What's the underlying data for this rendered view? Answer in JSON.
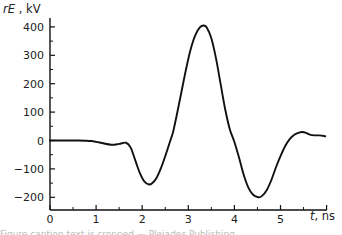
{
  "chart_data": {
    "type": "line",
    "title": "",
    "xlabel": "t, ns",
    "ylabel": "rE , kV",
    "x_label_italic_part": "t",
    "x_label_unit": ", ns",
    "y_label_italic_part": "rE",
    "y_label_unit": " , kV",
    "xlim": [
      0,
      6
    ],
    "ylim": [
      -250,
      440
    ],
    "x_ticks": [
      0,
      1,
      2,
      3,
      4,
      5
    ],
    "x_minor_step": 0.5,
    "y_ticks": [
      400,
      300,
      200,
      100,
      0,
      -100,
      -200
    ],
    "y_minor_step": 50,
    "grid": false,
    "legend": null,
    "series": [
      {
        "name": "rE",
        "color": "#111111",
        "x": [
          0.0,
          0.3,
          0.6,
          0.9,
          1.1,
          1.33,
          1.5,
          1.65,
          1.75,
          1.85,
          1.95,
          2.05,
          2.15,
          2.22,
          2.3,
          2.4,
          2.5,
          2.6,
          2.67,
          2.75,
          2.85,
          2.95,
          3.05,
          3.15,
          3.25,
          3.33,
          3.4,
          3.5,
          3.6,
          3.7,
          3.8,
          3.9,
          4.0,
          4.1,
          4.2,
          4.3,
          4.4,
          4.52,
          4.6,
          4.7,
          4.8,
          4.9,
          5.0,
          5.1,
          5.2,
          5.3,
          5.4,
          5.48,
          5.55,
          5.65,
          5.75,
          5.85,
          5.97
        ],
        "y": [
          0,
          0,
          0,
          -2,
          -8,
          -15,
          -12,
          -8,
          -25,
          -70,
          -115,
          -145,
          -155,
          -150,
          -135,
          -100,
          -55,
          -5,
          30,
          90,
          170,
          250,
          320,
          370,
          398,
          405,
          398,
          360,
          290,
          200,
          110,
          40,
          -5,
          -60,
          -120,
          -165,
          -190,
          -200,
          -195,
          -175,
          -140,
          -95,
          -55,
          -20,
          5,
          20,
          28,
          30,
          27,
          20,
          18,
          18,
          15
        ]
      }
    ]
  },
  "caption": {
    "text": "Figure caption text is cropped — Pleiades Publishing"
  }
}
